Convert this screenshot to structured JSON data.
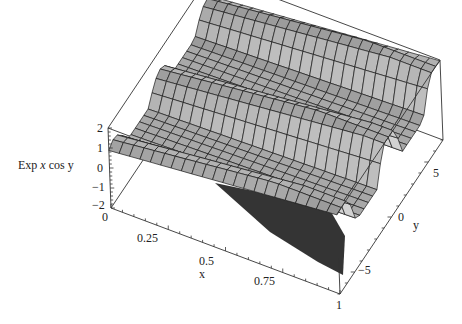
{
  "chart_data": {
    "type": "surface3d",
    "title": "",
    "function_label": "Exp x cos y",
    "zlabel": "Exp x cos y",
    "xlabel": "x",
    "ylabel": "y",
    "x_range": [
      0,
      1
    ],
    "y_range": [
      -7,
      7
    ],
    "z_range": [
      -2,
      2
    ],
    "x_ticks": [
      "0",
      "0.25",
      "0.5",
      "0.75",
      "1"
    ],
    "y_ticks": [
      "-5",
      "0",
      "5"
    ],
    "z_ticks": [
      "-2",
      "-1",
      "0",
      "1",
      "2"
    ],
    "surface": {
      "description": "Ridged surface: three ridges along x at y≈-6, y≈0, y≈6, valleys between; z ≈ e^x cos y amplitude-limited",
      "grid_x_count": 22,
      "grid_y_count": 24,
      "face_color": "#a8a8a8",
      "mesh_color": "#1a1a1a",
      "shadow_color": "#111111"
    },
    "box": true,
    "grid": false
  },
  "axes": {
    "z_tick_labels": [
      "2",
      "1",
      "0",
      "−1",
      "−2"
    ],
    "x_tick_labels": [
      "0",
      "0.25",
      "0.5",
      "0.75",
      "1"
    ],
    "y_tick_labels": [
      "5",
      "0",
      "−5"
    ],
    "x_title": "x",
    "y_title": "y",
    "z_title_prefix": "Exp ",
    "z_title_var1": "x",
    "z_title_mid": " cos ",
    "z_title_var2": "y"
  }
}
